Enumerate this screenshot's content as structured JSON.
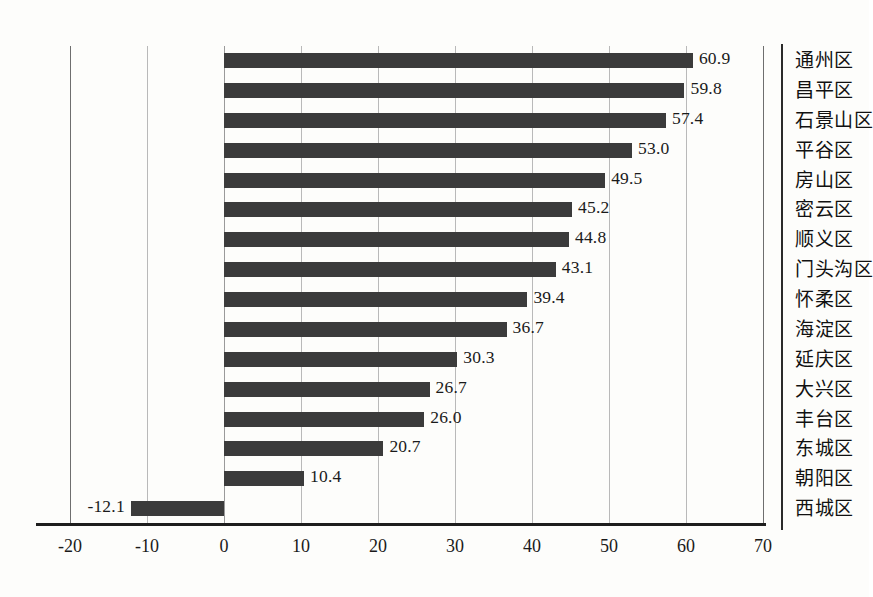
{
  "chart_data": {
    "type": "bar",
    "orientation": "horizontal",
    "title": "",
    "subtitle": "",
    "xlabel": "",
    "ylabel": "",
    "xlim": [
      -20,
      70
    ],
    "xticks": [
      "-20",
      "-10",
      "0",
      "10",
      "20",
      "30",
      "40",
      "50",
      "60",
      "70"
    ],
    "xtick_values": [
      -20,
      -10,
      0,
      10,
      20,
      30,
      40,
      50,
      60,
      70
    ],
    "grid": "vertical",
    "legend": "none",
    "categories": [
      "通州区",
      "昌平区",
      "石景山区",
      "平谷区",
      "房山区",
      "密云区",
      "顺义区",
      "门头沟区",
      "怀柔区",
      "海淀区",
      "延庆区",
      "大兴区",
      "丰台区",
      "东城区",
      "朝阳区",
      "西城区"
    ],
    "values": [
      60.9,
      59.8,
      57.4,
      53.0,
      49.5,
      45.2,
      44.8,
      43.1,
      39.4,
      36.7,
      30.3,
      26.7,
      26.0,
      20.7,
      10.4,
      -12.1
    ],
    "data_labels": [
      "60.9",
      "59.8",
      "57.4",
      "53.0",
      "49.5",
      "45.2",
      "44.8",
      "43.1",
      "39.4",
      "36.7",
      "30.3",
      "26.7",
      "26.0",
      "20.7",
      "10.4",
      "-12.1"
    ],
    "colors": {
      "bar": "#3b3b3b",
      "gridline": "#b9b9b9",
      "axis": "#1d1d1d",
      "text": "#1a1a1a",
      "background": "#fdfdfb"
    }
  }
}
